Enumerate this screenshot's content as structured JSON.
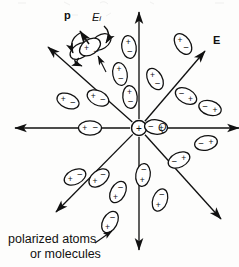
{
  "figure": {
    "background_color": "#fdfdfc",
    "ink_color": "#111111"
  },
  "center_charge": {
    "name": "point-charge",
    "sign": "+",
    "label": "Q",
    "label_style": "italic",
    "x": 139,
    "y": 128,
    "radius": 7.5
  },
  "field_arrows": {
    "count": 8,
    "label": "E",
    "label_style": "bold",
    "label_x": 216,
    "label_y": 41,
    "lines": [
      {
        "name": "field-line-up",
        "angle_deg": 90,
        "x2": 139,
        "y2": 12
      },
      {
        "name": "field-line-up-right",
        "angle_deg": 45,
        "x2": 205,
        "y2": 51
      },
      {
        "name": "field-line-right",
        "angle_deg": 0,
        "x2": 239,
        "y2": 128
      },
      {
        "name": "field-line-down-right",
        "angle_deg": -45,
        "x2": 221,
        "y2": 219
      },
      {
        "name": "field-line-down",
        "angle_deg": -90,
        "x2": 139,
        "y2": 250
      },
      {
        "name": "field-line-down-left",
        "angle_deg": -135,
        "x2": 56,
        "y2": 212
      },
      {
        "name": "field-line-left",
        "angle_deg": 180,
        "x2": 15,
        "y2": 128
      },
      {
        "name": "field-line-up-left",
        "angle_deg": 135,
        "x2": 48,
        "y2": 47
      }
    ]
  },
  "dipole_labels": {
    "polarization": {
      "text": "p",
      "style": "bold",
      "x": 68,
      "y": 18
    },
    "internal_field": {
      "text": "E",
      "subscript": "i",
      "style": "italic",
      "x": 96,
      "y": 20
    }
  },
  "dipole_cluster": {
    "name": "dipole-cluster-detail",
    "x": 88,
    "y": 47,
    "ellipse_count": 3,
    "charges": [
      "+",
      "-"
    ],
    "arrows": [
      "polarization-arrow",
      "torque-arrow-upper",
      "torque-arrow-lower",
      "field-pointer-arrow"
    ]
  },
  "dipoles": [
    {
      "name": "dipole-1",
      "cx": 129,
      "cy": 47,
      "rot": 82,
      "plus": "+",
      "minus": "-"
    },
    {
      "name": "dipole-2",
      "cx": 155,
      "cy": 79,
      "rot": 62,
      "plus": "+",
      "minus": "-"
    },
    {
      "name": "dipole-3",
      "cx": 130,
      "cy": 97,
      "rot": 85,
      "plus": "+",
      "minus": "-"
    },
    {
      "name": "dipole-4",
      "cx": 183,
      "cy": 44,
      "rot": 56,
      "plus": "+",
      "minus": "-"
    },
    {
      "name": "dipole-5",
      "cx": 186,
      "cy": 96,
      "rot": 29,
      "plus": "+",
      "minus": "-"
    },
    {
      "name": "dipole-6",
      "cx": 210,
      "cy": 108,
      "rot": 17,
      "plus": "+",
      "minus": "-"
    },
    {
      "name": "dipole-7",
      "cx": 206,
      "cy": 143,
      "rot": -12,
      "plus": "+",
      "minus": "-"
    },
    {
      "name": "dipole-8",
      "cx": 179,
      "cy": 160,
      "rot": -26,
      "plus": "+",
      "minus": "-"
    },
    {
      "name": "dipole-9",
      "cx": 156,
      "cy": 127,
      "rot": 6,
      "plus": "+",
      "minus": "-"
    },
    {
      "name": "dipole-10",
      "cx": 143,
      "cy": 175,
      "rot": -82,
      "plus": "+",
      "minus": "-"
    },
    {
      "name": "dipole-11",
      "cx": 118,
      "cy": 192,
      "rot": -62,
      "plus": "+",
      "minus": "-"
    },
    {
      "name": "dipole-12",
      "cx": 160,
      "cy": 200,
      "rot": -71,
      "plus": "+",
      "minus": "-"
    },
    {
      "name": "dipole-13",
      "cx": 90,
      "cy": 128,
      "rot": 0,
      "plus": "+",
      "minus": "-"
    },
    {
      "name": "dipole-14",
      "cx": 68,
      "cy": 101,
      "rot": 22,
      "plus": "+",
      "minus": "-"
    },
    {
      "name": "dipole-15",
      "cx": 98,
      "cy": 98,
      "rot": 26,
      "plus": "+",
      "minus": "-"
    },
    {
      "name": "dipole-16",
      "cx": 75,
      "cy": 177,
      "rot": -26,
      "plus": "+",
      "minus": "-"
    },
    {
      "name": "dipole-17",
      "cx": 99,
      "cy": 178,
      "rot": -38,
      "plus": "+",
      "minus": "-"
    },
    {
      "name": "dipole-18",
      "cx": 110,
      "cy": 222,
      "rot": -62,
      "plus": "+",
      "minus": "-"
    },
    {
      "name": "dipole-19",
      "cx": 120,
      "cy": 74,
      "rot": 80,
      "plus": "+",
      "minus": "-"
    }
  ],
  "caption": {
    "name": "figure-caption",
    "line1": "polarized atoms",
    "line2": "or molecules",
    "x": 8,
    "y": 238,
    "leader": {
      "name": "caption-leader-line",
      "x1": 95,
      "y1": 243,
      "x2": 112,
      "y2": 231
    }
  }
}
